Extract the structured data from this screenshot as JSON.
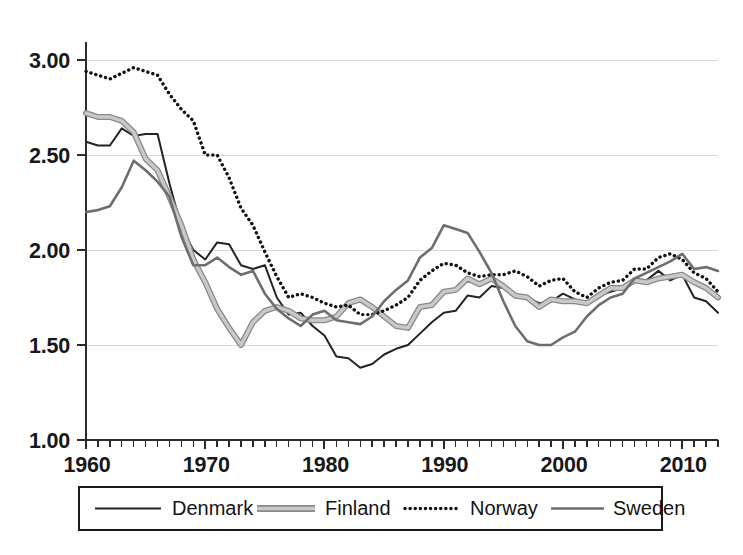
{
  "chart_data": {
    "type": "line",
    "title": "",
    "subtitle": "",
    "xlabel": "",
    "ylabel": "",
    "xlim": [
      1960,
      2013
    ],
    "ylim": [
      1.0,
      3.0
    ],
    "grid": true,
    "grid_axis": "y",
    "legend_position": "bottom",
    "x": [
      1960,
      1961,
      1962,
      1963,
      1964,
      1965,
      1966,
      1967,
      1968,
      1969,
      1970,
      1971,
      1972,
      1973,
      1974,
      1975,
      1976,
      1977,
      1978,
      1979,
      1980,
      1981,
      1982,
      1983,
      1984,
      1985,
      1986,
      1987,
      1988,
      1989,
      1990,
      1991,
      1992,
      1993,
      1994,
      1995,
      1996,
      1997,
      1998,
      1999,
      2000,
      2001,
      2002,
      2003,
      2004,
      2005,
      2006,
      2007,
      2008,
      2009,
      2010,
      2011,
      2012,
      2013
    ],
    "ytick_labels": [
      "1.00",
      "1.50",
      "2.00",
      "2.50",
      "3.00"
    ],
    "ytick_values": [
      1.0,
      1.5,
      2.0,
      2.5,
      3.0
    ],
    "xtick_labels": [
      "1960",
      "1970",
      "1980",
      "1990",
      "2000",
      "2010"
    ],
    "xtick_values": [
      1960,
      1970,
      1980,
      1990,
      2000,
      2010
    ],
    "xtick_minor_step": 1,
    "series": [
      {
        "name": "Denmark",
        "style": "solid",
        "color": "#242424",
        "width": 2.0,
        "values": [
          2.57,
          2.55,
          2.55,
          2.64,
          2.6,
          2.61,
          2.61,
          2.35,
          2.12,
          2.0,
          1.95,
          2.04,
          2.03,
          1.92,
          1.9,
          1.92,
          1.75,
          1.66,
          1.67,
          1.6,
          1.55,
          1.44,
          1.43,
          1.38,
          1.4,
          1.45,
          1.48,
          1.5,
          1.56,
          1.62,
          1.67,
          1.68,
          1.76,
          1.75,
          1.81,
          1.8,
          1.75,
          1.75,
          1.72,
          1.73,
          1.77,
          1.74,
          1.72,
          1.76,
          1.78,
          1.8,
          1.85,
          1.84,
          1.89,
          1.84,
          1.87,
          1.75,
          1.73,
          1.67
        ]
      },
      {
        "name": "Finland",
        "style": "outlined",
        "color": "#c9c9c9",
        "outline": "#8a8a8a",
        "width": 4.4,
        "values": [
          2.72,
          2.7,
          2.7,
          2.68,
          2.62,
          2.48,
          2.42,
          2.28,
          2.13,
          1.95,
          1.83,
          1.69,
          1.59,
          1.5,
          1.62,
          1.68,
          1.7,
          1.68,
          1.64,
          1.63,
          1.63,
          1.65,
          1.72,
          1.74,
          1.7,
          1.65,
          1.6,
          1.59,
          1.7,
          1.71,
          1.78,
          1.79,
          1.85,
          1.82,
          1.85,
          1.81,
          1.76,
          1.75,
          1.7,
          1.74,
          1.73,
          1.73,
          1.72,
          1.76,
          1.8,
          1.8,
          1.84,
          1.83,
          1.85,
          1.86,
          1.87,
          1.83,
          1.8,
          1.75
        ]
      },
      {
        "name": "Norway",
        "style": "dotted",
        "color": "#121212",
        "width": 3.4,
        "values": [
          2.94,
          2.92,
          2.9,
          2.93,
          2.96,
          2.94,
          2.92,
          2.82,
          2.74,
          2.68,
          2.5,
          2.5,
          2.38,
          2.22,
          2.13,
          1.99,
          1.86,
          1.75,
          1.77,
          1.75,
          1.72,
          1.7,
          1.71,
          1.66,
          1.66,
          1.68,
          1.71,
          1.75,
          1.84,
          1.89,
          1.93,
          1.92,
          1.88,
          1.86,
          1.87,
          1.87,
          1.89,
          1.86,
          1.81,
          1.84,
          1.85,
          1.78,
          1.75,
          1.8,
          1.83,
          1.84,
          1.9,
          1.9,
          1.96,
          1.98,
          1.95,
          1.88,
          1.85,
          1.78
        ]
      },
      {
        "name": "Sweden",
        "style": "solid",
        "color": "#6e6e6e",
        "width": 2.6,
        "values": [
          2.2,
          2.21,
          2.23,
          2.33,
          2.47,
          2.42,
          2.36,
          2.28,
          2.07,
          1.92,
          1.92,
          1.96,
          1.91,
          1.87,
          1.89,
          1.77,
          1.69,
          1.64,
          1.6,
          1.66,
          1.68,
          1.63,
          1.62,
          1.61,
          1.65,
          1.73,
          1.79,
          1.84,
          1.96,
          2.01,
          2.13,
          2.11,
          2.09,
          1.99,
          1.88,
          1.73,
          1.6,
          1.52,
          1.5,
          1.5,
          1.54,
          1.57,
          1.65,
          1.71,
          1.75,
          1.77,
          1.85,
          1.88,
          1.91,
          1.94,
          1.98,
          1.9,
          1.91,
          1.89
        ]
      }
    ]
  },
  "legend": {
    "items": [
      {
        "label": "Denmark"
      },
      {
        "label": "Finland"
      },
      {
        "label": "Norway"
      },
      {
        "label": "Sweden"
      }
    ]
  }
}
